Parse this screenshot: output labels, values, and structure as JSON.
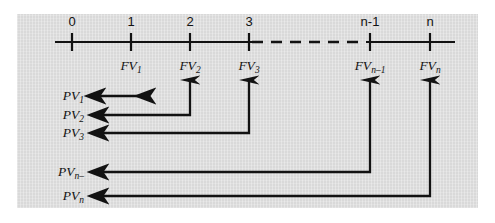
{
  "figure": {
    "background_color": "#ffffff",
    "panel_color": "#d9d9d9",
    "line_color": "#121212"
  },
  "timeline": {
    "axis_start_x": 55,
    "axis_end_x": 455,
    "axis_y": 42,
    "tick_spacing": 59,
    "dash_segment": {
      "from_x": 252,
      "to_x": 366
    },
    "periods": [
      {
        "label": "0",
        "x": 72,
        "tick": true
      },
      {
        "label": "1",
        "x": 131,
        "tick": true
      },
      {
        "label": "2",
        "x": 190,
        "tick": true
      },
      {
        "label": "3",
        "x": 249,
        "tick": true
      },
      {
        "label": "n-1",
        "x": 370,
        "tick": true
      },
      {
        "label": "n",
        "x": 430,
        "tick": true
      }
    ],
    "future_values": [
      {
        "label": "FV",
        "sub": "1",
        "x": 131
      },
      {
        "label": "FV",
        "sub": "2",
        "x": 190
      },
      {
        "label": "FV",
        "sub": "3",
        "x": 249
      },
      {
        "label": "FV",
        "sub": "n–1",
        "x": 370
      },
      {
        "label": "FV",
        "sub": "n",
        "x": 430
      }
    ]
  },
  "present_values": [
    {
      "label": "PV",
      "sub": "1",
      "label_x": 86,
      "y": 96,
      "arrow_type": "double-headed",
      "from_x": 88,
      "to_x": 140,
      "riser_x": null
    },
    {
      "label": "PV",
      "sub": "2",
      "label_x": 86,
      "y": 115,
      "arrow_type": "elbow",
      "from_x": 92,
      "to_x": 190,
      "riser_x": 190,
      "riser_top_y": 78
    },
    {
      "label": "PV",
      "sub": "3",
      "label_x": 86,
      "y": 133,
      "arrow_type": "elbow",
      "from_x": 92,
      "to_x": 249,
      "riser_x": 249,
      "riser_top_y": 78
    },
    {
      "label": "PV",
      "sub": "n–",
      "label_x": 86,
      "y": 172,
      "arrow_type": "elbow",
      "from_x": 92,
      "to_x": 370,
      "riser_x": 370,
      "riser_top_y": 78
    },
    {
      "label": "PV",
      "sub": "n",
      "label_x": 86,
      "y": 196,
      "arrow_type": "elbow",
      "from_x": 92,
      "to_x": 430,
      "riser_x": 430,
      "riser_top_y": 78
    }
  ]
}
